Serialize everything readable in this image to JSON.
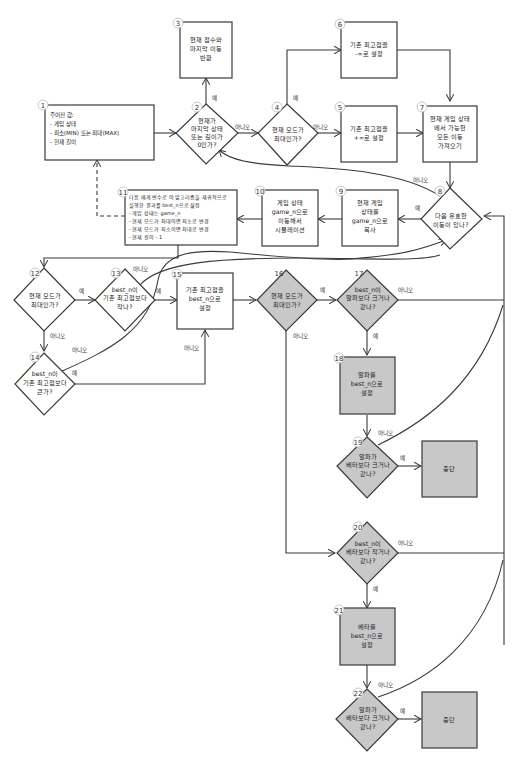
{
  "nodes": {
    "n1": {
      "num": "1",
      "lines": [
        "주어진 값:",
        "- 게임 상태",
        "- 최소(MIN) 또는 최대(MAX)",
        "- 현재 길이"
      ]
    },
    "n2": {
      "num": "2",
      "lines": [
        "현재가",
        "마지막 상태",
        "또는 길이가",
        "0인가?"
      ]
    },
    "n3": {
      "num": "3",
      "lines": [
        "현재 점수와",
        "마지막 이동",
        "반환"
      ]
    },
    "n4": {
      "num": "4",
      "lines": [
        "현재 모드가",
        "최대인가?"
      ]
    },
    "n5": {
      "num": "5",
      "lines": [
        "기존 최고점을",
        "+∞로 설정"
      ]
    },
    "n6": {
      "num": "6",
      "lines": [
        "기존 최고점을",
        "-∞로 설정"
      ]
    },
    "n7": {
      "num": "7",
      "lines": [
        "현재 게임 상태",
        "에서 가능한",
        "모든 이동",
        "가져오기"
      ]
    },
    "n8": {
      "num": "8",
      "lines": [
        "다음 유효한",
        "이동이 있나?"
      ]
    },
    "n9": {
      "num": "9",
      "lines": [
        "현재 게임",
        "상태를",
        "game_n으로",
        "복사"
      ]
    },
    "n10": {
      "num": "10",
      "lines": [
        "게임 상태",
        "game_n으로",
        "이동해서",
        "시뮬레이션"
      ]
    },
    "n11": {
      "num": "11",
      "lines": [
        "다음 매개 변수로 이 알고리즘을 재귀적으로",
        "실행한 결과를 best_n으로 설정",
        "- 게임 상태는 game_n",
        "- 현재 모드가 최대이면 최소로 변경",
        "- 현재 모드가 최소이면 최대로 변경",
        "- 현재 길이 - 1"
      ]
    },
    "n12": {
      "num": "12",
      "lines": [
        "현재 모드가",
        "최대인가?"
      ]
    },
    "n13": {
      "num": "13",
      "lines": [
        "best_n이",
        "기존 최고점보다",
        "작나?"
      ]
    },
    "n14": {
      "num": "14",
      "lines": [
        "best_n이",
        "기존 최고점보다",
        "큰가?"
      ]
    },
    "n15": {
      "num": "15",
      "lines": [
        "기존 최고점을",
        "best_n으로",
        "설정"
      ]
    },
    "n16": {
      "num": "16",
      "lines": [
        "현재 모드가",
        "최대인가?"
      ]
    },
    "n17": {
      "num": "17",
      "lines": [
        "best_n이",
        "알파보다 크거나",
        "같나?"
      ]
    },
    "n18": {
      "num": "18",
      "lines": [
        "알파를",
        "best_n으로",
        "설정"
      ]
    },
    "n19": {
      "num": "19",
      "lines": [
        "알파가",
        "베타보다 크거나",
        "같나?"
      ]
    },
    "n20": {
      "num": "20",
      "lines": [
        "best_n이",
        "베타보다 작거나",
        "같나?"
      ]
    },
    "n21": {
      "num": "21",
      "lines": [
        "베타를",
        "best_n으로",
        "설정"
      ]
    },
    "n22": {
      "num": "22",
      "lines": [
        "알파가",
        "베타보다 크거나",
        "같나?"
      ]
    },
    "stop1": {
      "lines": [
        "중단"
      ]
    },
    "stop2": {
      "lines": [
        "중단"
      ]
    }
  },
  "edge_labels": {
    "yes": "예",
    "no": "아니오"
  },
  "colors": {
    "line": "#3a3a3a",
    "gray_fill": "#c8c8c8"
  }
}
